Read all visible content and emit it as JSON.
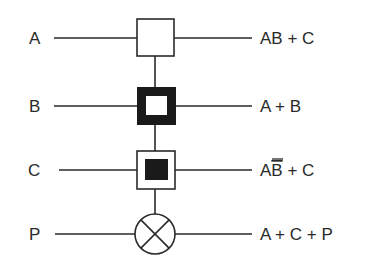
{
  "diagram": {
    "type": "quantum-circuit-gate-notation",
    "colors": {
      "stroke": "#2a2a2a",
      "fill_dark": "#1a1a1a",
      "background": "#ffffff"
    },
    "rows": [
      {
        "input": "A",
        "gate": "hollow-square",
        "output_main": "AB + C",
        "output_prefix": "",
        "output_overline": "",
        "output_suffix": ""
      },
      {
        "input": "B",
        "gate": "thick-border-square",
        "output_main": "A + B",
        "output_prefix": "",
        "output_overline": "",
        "output_suffix": ""
      },
      {
        "input": "C",
        "gate": "filled-inner-square",
        "output_main": "",
        "output_prefix": "A",
        "output_overline": "B",
        "output_suffix": " + C"
      },
      {
        "input": "P",
        "gate": "circle-cross",
        "output_main": "A + C + P",
        "output_prefix": "",
        "output_overline": "",
        "output_suffix": ""
      }
    ]
  }
}
